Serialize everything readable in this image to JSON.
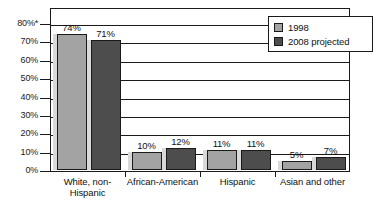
{
  "chart_data": {
    "type": "bar",
    "title": "",
    "subtitle": "",
    "xlabel": "",
    "ylabel": "",
    "ylim": [
      0,
      80
    ],
    "grid": true,
    "legend_position": "top-right",
    "categories": [
      "White, non-Hispanic",
      "African-American",
      "Hispanic",
      "Asian and other"
    ],
    "category_lines": [
      [
        "White, non-",
        "Hispanic"
      ],
      [
        "African-American"
      ],
      [
        "Hispanic"
      ],
      [
        "Asian and other"
      ]
    ],
    "series": [
      {
        "name": "1998",
        "color": "#a3a3a3",
        "values": [
          74,
          10,
          11,
          5
        ],
        "value_labels": [
          "74%",
          "10%",
          "11%",
          "5%"
        ]
      },
      {
        "name": "2008 projected",
        "color": "#4d4d4d",
        "values": [
          71,
          12,
          11,
          7
        ],
        "value_labels": [
          "71%",
          "12%",
          "11%",
          "7%"
        ]
      }
    ],
    "y_ticks": [
      0,
      10,
      20,
      30,
      40,
      50,
      60,
      70,
      80
    ],
    "y_tick_labels": [
      "0%",
      "10%",
      "20%",
      "30%",
      "40%",
      "50%",
      "60%",
      "70%",
      "80%*"
    ]
  },
  "legend": {
    "items": [
      {
        "label": "1998",
        "color": "#a3a3a3"
      },
      {
        "label": "2008 projected",
        "color": "#4d4d4d"
      }
    ]
  },
  "colors": {
    "series_1998": "#a3a3a3",
    "series_2008": "#4d4d4d",
    "axis": "#1a1a1a",
    "shadow": "#d9d9d9",
    "background": "#ffffff"
  }
}
